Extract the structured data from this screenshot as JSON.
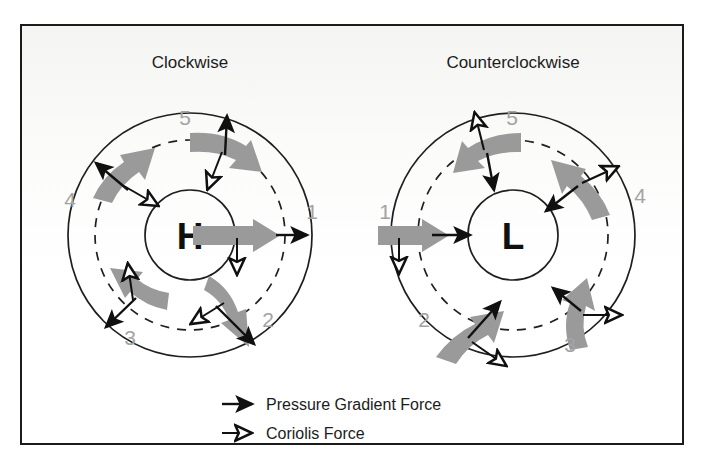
{
  "figure": {
    "width": 702,
    "height": 470,
    "background": "#ffffff",
    "frame_color": "#1b1b1b"
  },
  "colors": {
    "wind_arrow": "#9a9a9a",
    "force_arrow": "#101010",
    "number_label": "#a3a3a3",
    "circle_stroke": "#1f1f1f",
    "text": "#1c1c1c"
  },
  "panels": [
    {
      "id": "high-pressure",
      "title": "Clockwise",
      "center_label": "H",
      "center": {
        "x": 190,
        "y": 235
      },
      "radii": {
        "outer": 122,
        "dashed": 95,
        "inner": 45
      },
      "rotation_sense": "clockwise",
      "stations": [
        {
          "number": "1",
          "angle_deg": 0,
          "label_x": 312,
          "label_y": 219,
          "wind_dir_deg": 0,
          "pgf_dir_deg": 0,
          "coriolis_dir_deg": 90
        },
        {
          "number": "2",
          "angle_deg": 55,
          "label_x": 268,
          "label_y": 327,
          "wind_dir_deg": 55,
          "pgf_dir_deg": 55,
          "coriolis_dir_deg": 235
        },
        {
          "number": "3",
          "angle_deg": 140,
          "label_x": 130,
          "label_y": 345,
          "wind_dir_deg": 230,
          "pgf_dir_deg": 140,
          "coriolis_dir_deg": 275
        },
        {
          "number": "4",
          "angle_deg": 205,
          "label_x": 70,
          "label_y": 207,
          "wind_dir_deg": 295,
          "pgf_dir_deg": 205,
          "coriolis_dir_deg": 25
        },
        {
          "number": "5",
          "angle_deg": 285,
          "label_x": 185,
          "label_y": 125,
          "wind_dir_deg": 15,
          "pgf_dir_deg": 285,
          "coriolis_dir_deg": 120
        }
      ]
    },
    {
      "id": "low-pressure",
      "title": "Counterclockwise",
      "center_label": "L",
      "center": {
        "x": 513,
        "y": 235
      },
      "radii": {
        "outer": 122,
        "dashed": 95,
        "inner": 45
      },
      "rotation_sense": "counterclockwise",
      "stations": [
        {
          "number": "1",
          "angle_deg": 180,
          "label_x": 385,
          "label_y": 219,
          "wind_dir_deg": 0,
          "pgf_dir_deg": 0,
          "coriolis_dir_deg": 90
        },
        {
          "number": "2",
          "angle_deg": 125,
          "label_x": 424,
          "label_y": 327,
          "wind_dir_deg": 305,
          "pgf_dir_deg": 305,
          "coriolis_dir_deg": 55
        },
        {
          "number": "3",
          "angle_deg": 55,
          "label_x": 570,
          "label_y": 352,
          "wind_dir_deg": 235,
          "pgf_dir_deg": 235,
          "coriolis_dir_deg": 0
        },
        {
          "number": "4",
          "angle_deg": 315,
          "label_x": 640,
          "label_y": 203,
          "wind_dir_deg": 225,
          "pgf_dir_deg": 225,
          "coriolis_dir_deg": 315
        },
        {
          "number": "5",
          "angle_deg": 255,
          "label_x": 512,
          "label_y": 125,
          "wind_dir_deg": 180,
          "pgf_dir_deg": 75,
          "coriolis_dir_deg": 260
        }
      ]
    }
  ],
  "legend": {
    "items": [
      {
        "label": "Pressure Gradient Force",
        "arrow_style": "solid-head",
        "icon": "solid-arrow-icon"
      },
      {
        "label": "Coriolis Force",
        "arrow_style": "open-head",
        "icon": "open-arrow-icon"
      }
    ],
    "x": 215,
    "y_first": 404,
    "row_gap": 30
  }
}
